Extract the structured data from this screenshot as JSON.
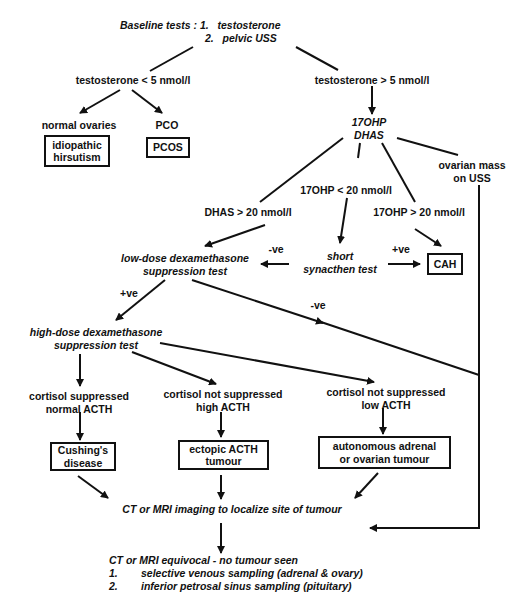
{
  "baseline": {
    "label": "Baseline tests :",
    "items": [
      "1.   testosterone",
      "2.   pelvic USS"
    ]
  },
  "branches": {
    "testo_low": "testosterone < 5 nmol/l",
    "testo_high": "testosterone > 5 nmol/l",
    "normal_ovaries": "normal ovaries",
    "pco": "PCO",
    "ohp_dhas": [
      "17OHP",
      "DHAS"
    ],
    "ovarian_mass": [
      "ovarian mass",
      "on USS"
    ],
    "ohp_lt20": "17OHP < 20 nmol/l",
    "dhas_gt20": "DHAS > 20 nmol/l",
    "ohp_gt20": "17OHP > 20 nmol/l",
    "neg": "-ve",
    "pos": "+ve",
    "low_dose": [
      "low-dose dexamethasone",
      "suppression test"
    ],
    "short_syn": [
      "short",
      "synacthen test"
    ],
    "high_dose": [
      "high-dose dexamethasone",
      "suppression test"
    ],
    "cort_supp": [
      "cortisol suppressed",
      "normal ACTH"
    ],
    "cort_not_high": [
      "cortisol not suppressed",
      "high ACTH"
    ],
    "cort_not_low": [
      "cortisol not suppressed",
      "low ACTH"
    ],
    "ct_mri": "CT or MRI imaging to localize site of tumour"
  },
  "boxes": {
    "idiopathic": [
      "idiopathic",
      "hirsutism"
    ],
    "pcos": [
      "PCOS"
    ],
    "cah": [
      "CAH"
    ],
    "cushings": [
      "Cushing's",
      "disease"
    ],
    "ectopic": [
      "ectopic ACTH",
      "tumour"
    ],
    "autonomous": [
      "autonomous adrenal",
      "or ovarian tumour"
    ]
  },
  "footer": {
    "title": "CT or MRI equivocal - no tumour seen",
    "items": [
      {
        "num": "1.",
        "text": "selective venous sampling (adrenal & ovary)"
      },
      {
        "num": "2.",
        "text": "inferior petrosal sinus sampling (pituitary)"
      }
    ]
  }
}
